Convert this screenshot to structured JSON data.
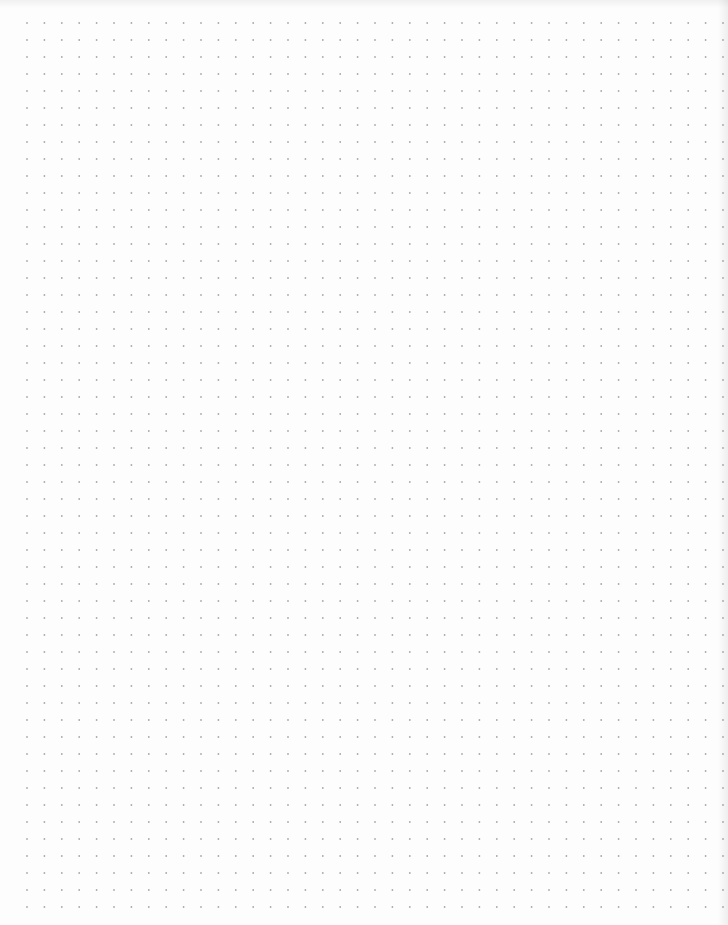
{
  "page": {
    "type": "dot-grid-paper",
    "background_color": "#fdfdfd",
    "dot_color": "#a9a9a9"
  },
  "grid": {
    "origin_x": 27,
    "origin_y": 23,
    "spacing_x": 17.4,
    "spacing_y": 17.0,
    "columns": 41,
    "rows": 53,
    "dot_radius": 0.9
  }
}
